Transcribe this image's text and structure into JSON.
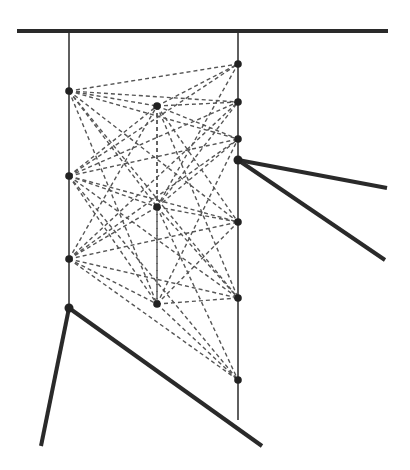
{
  "diagram": {
    "type": "structural truss / tensegrity network",
    "width": 410,
    "height": 470,
    "colors": {
      "background": "#ffffff",
      "stroke": "#2a2a2a",
      "dashed": "#555555",
      "node": "#222222"
    },
    "top_beam": {
      "x1": 17,
      "y1": 31,
      "x2": 388,
      "y2": 31,
      "width": 4
    },
    "verticals": [
      {
        "name": "left-post",
        "x1": 69,
        "y1": 31,
        "x2": 69,
        "y2": 308
      },
      {
        "name": "right-post",
        "x1": 238,
        "y1": 31,
        "x2": 238,
        "y2": 420
      },
      {
        "name": "middle-dashed-post",
        "x1": 157,
        "y1": 106,
        "x2": 157,
        "y2": 304,
        "dashed": true
      }
    ],
    "nodes": [
      {
        "id": "L1",
        "x": 69,
        "y": 91
      },
      {
        "id": "L2",
        "x": 69,
        "y": 176
      },
      {
        "id": "L3",
        "x": 69,
        "y": 259
      },
      {
        "id": "L4",
        "x": 69,
        "y": 308
      },
      {
        "id": "M1",
        "x": 157,
        "y": 106
      },
      {
        "id": "M2",
        "x": 157,
        "y": 207
      },
      {
        "id": "M3",
        "x": 157,
        "y": 304
      },
      {
        "id": "R1",
        "x": 238,
        "y": 64
      },
      {
        "id": "R2",
        "x": 238,
        "y": 102
      },
      {
        "id": "R3",
        "x": 238,
        "y": 139
      },
      {
        "id": "R4",
        "x": 238,
        "y": 160
      },
      {
        "id": "R5",
        "x": 238,
        "y": 222
      },
      {
        "id": "R6",
        "x": 238,
        "y": 298
      },
      {
        "id": "R7",
        "x": 238,
        "y": 380
      }
    ],
    "thick_members": [
      {
        "x1": 238,
        "y1": 160,
        "x2": 387,
        "y2": 188
      },
      {
        "x1": 238,
        "y1": 160,
        "x2": 385,
        "y2": 260
      },
      {
        "x1": 69,
        "y1": 308,
        "x2": 41,
        "y2": 446
      },
      {
        "x1": 69,
        "y1": 308,
        "x2": 262,
        "y2": 446
      }
    ],
    "dashed_connections": [
      [
        "L1",
        "R1"
      ],
      [
        "L1",
        "R2"
      ],
      [
        "L1",
        "R3"
      ],
      [
        "L1",
        "M1"
      ],
      [
        "L1",
        "M2"
      ],
      [
        "L1",
        "R5"
      ],
      [
        "L1",
        "M3"
      ],
      [
        "L1",
        "R6"
      ],
      [
        "L2",
        "R1"
      ],
      [
        "L2",
        "R2"
      ],
      [
        "L2",
        "R3"
      ],
      [
        "L2",
        "M1"
      ],
      [
        "L2",
        "M2"
      ],
      [
        "L2",
        "R5"
      ],
      [
        "L2",
        "M3"
      ],
      [
        "L2",
        "R6"
      ],
      [
        "L2",
        "R7"
      ],
      [
        "L3",
        "R2"
      ],
      [
        "L3",
        "R3"
      ],
      [
        "L3",
        "M1"
      ],
      [
        "L3",
        "M2"
      ],
      [
        "L3",
        "R5"
      ],
      [
        "L3",
        "M3"
      ],
      [
        "L3",
        "R6"
      ],
      [
        "L3",
        "R7"
      ],
      [
        "M1",
        "R1"
      ],
      [
        "M1",
        "R2"
      ],
      [
        "M1",
        "R3"
      ],
      [
        "M1",
        "R5"
      ],
      [
        "M1",
        "R6"
      ],
      [
        "M2",
        "R1"
      ],
      [
        "M2",
        "R2"
      ],
      [
        "M2",
        "R3"
      ],
      [
        "M2",
        "R5"
      ],
      [
        "M2",
        "R6"
      ],
      [
        "M2",
        "R7"
      ],
      [
        "M3",
        "R3"
      ],
      [
        "M3",
        "R5"
      ],
      [
        "M3",
        "R6"
      ],
      [
        "M3",
        "R7"
      ],
      [
        "M1",
        "M2"
      ],
      [
        "M2",
        "M3"
      ]
    ]
  }
}
